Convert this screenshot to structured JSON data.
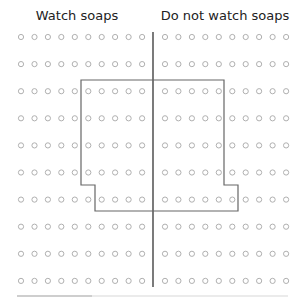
{
  "headers": {
    "left": "Watch soaps",
    "right": "Do not watch soaps"
  },
  "grid": {
    "rows": 10,
    "cols_per_side": 10,
    "left_x_start": 21,
    "right_x_start": 165,
    "x_step": 13.45,
    "y_start": 37,
    "y_step": 27.1,
    "circle_color": "#b0b0b0"
  },
  "divider": {
    "x": 153,
    "y1": 32,
    "y2": 287,
    "color": "#333333"
  },
  "sample_region": {
    "color": "#666666",
    "points": [
      [
        81,
        80
      ],
      [
        224,
        80
      ],
      [
        224,
        185
      ],
      [
        238,
        185
      ],
      [
        238,
        211
      ],
      [
        95,
        211
      ],
      [
        95,
        185
      ],
      [
        81,
        185
      ]
    ]
  },
  "footer_bar": {
    "y": 296,
    "x1": 17,
    "x2": 288,
    "dark_x2": 92
  }
}
